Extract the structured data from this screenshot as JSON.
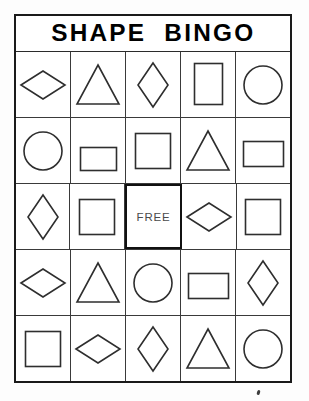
{
  "card": {
    "title": "SHAPE  BINGO",
    "free_label": "FREE",
    "colors": {
      "border": "#1a1a1a",
      "grid_line": "#3a3a3a",
      "shape_stroke": "#2e2e2e",
      "title_text": "#000000",
      "background": "#ffffff"
    },
    "grid_size": "5x5",
    "rows": [
      [
        {
          "shape": "diamond-wide",
          "label": "wide diamond"
        },
        {
          "shape": "triangle",
          "label": "triangle"
        },
        {
          "shape": "diamond-tall",
          "label": "tall diamond"
        },
        {
          "shape": "rectangle-portrait",
          "label": "portrait rectangle"
        },
        {
          "shape": "circle",
          "label": "circle"
        }
      ],
      [
        {
          "shape": "circle",
          "label": "circle"
        },
        {
          "shape": "rectangle-landscape-small",
          "label": "small landscape rectangle"
        },
        {
          "shape": "square",
          "label": "square"
        },
        {
          "shape": "triangle",
          "label": "triangle"
        },
        {
          "shape": "rectangle-landscape",
          "label": "landscape rectangle"
        }
      ],
      [
        {
          "shape": "diamond-tall",
          "label": "tall diamond"
        },
        {
          "shape": "square",
          "label": "square"
        },
        {
          "shape": "free",
          "label": "free space"
        },
        {
          "shape": "diamond-wide",
          "label": "wide diamond"
        },
        {
          "shape": "square",
          "label": "square"
        }
      ],
      [
        {
          "shape": "diamond-wide",
          "label": "wide diamond"
        },
        {
          "shape": "triangle",
          "label": "triangle"
        },
        {
          "shape": "circle",
          "label": "circle"
        },
        {
          "shape": "rectangle-landscape",
          "label": "landscape rectangle"
        },
        {
          "shape": "diamond-tall",
          "label": "tall diamond"
        }
      ],
      [
        {
          "shape": "square",
          "label": "square"
        },
        {
          "shape": "diamond-wide",
          "label": "wide diamond"
        },
        {
          "shape": "diamond-tall",
          "label": "tall diamond"
        },
        {
          "shape": "triangle",
          "label": "triangle"
        },
        {
          "shape": "circle",
          "label": "circle"
        }
      ]
    ]
  }
}
